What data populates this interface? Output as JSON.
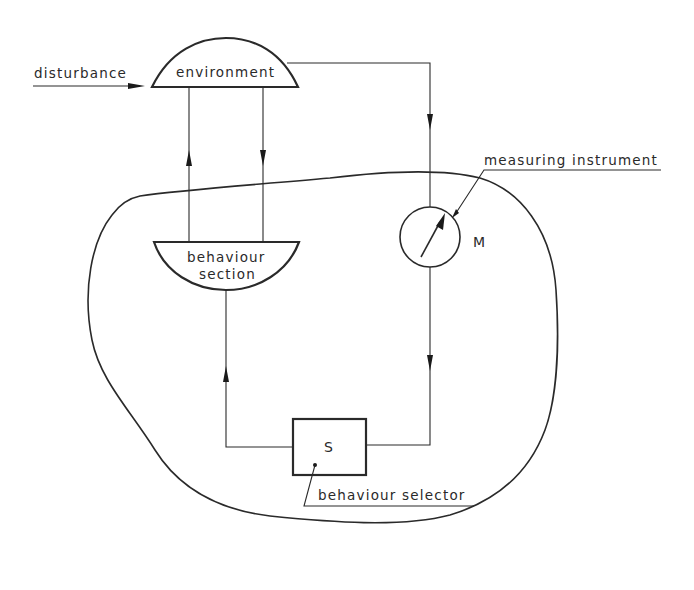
{
  "diagram": {
    "title": "",
    "colors": {
      "ink": "#2a2a2a",
      "background": "#ffffff"
    },
    "nodes": {
      "environment": {
        "label": "environment",
        "shape": "dome"
      },
      "behaviour_section": {
        "label_line1": "behaviour",
        "label_line2": "section",
        "shape": "bowl"
      },
      "measuring_instrument": {
        "symbol": "M",
        "shape": "gauge-circle"
      },
      "behaviour_selector": {
        "symbol": "S",
        "shape": "box"
      }
    },
    "labels": {
      "disturbance": "disturbance",
      "measuring_instrument": "measuring instrument",
      "behaviour_selector": "behaviour selector"
    },
    "edges": [
      {
        "from": "disturbance",
        "to": "environment",
        "direction": "right"
      },
      {
        "from": "behaviour_section",
        "to": "environment",
        "direction": "up"
      },
      {
        "from": "environment",
        "to": "behaviour_section",
        "direction": "down"
      },
      {
        "from": "environment",
        "to": "measuring_instrument",
        "direction": "down"
      },
      {
        "from": "measuring_instrument",
        "to": "behaviour_selector",
        "direction": "down"
      },
      {
        "from": "behaviour_selector",
        "to": "behaviour_section",
        "direction": "up"
      }
    ],
    "boundary": {
      "label": "",
      "shape": "irregular-closed-curve"
    }
  }
}
